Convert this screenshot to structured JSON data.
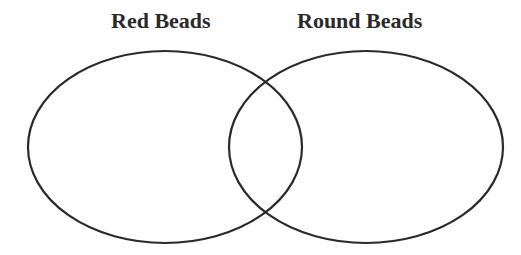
{
  "diagram": {
    "type": "venn",
    "sets": [
      {
        "label": "Red Beads",
        "cx": 165,
        "cy": 147,
        "rx": 137,
        "ry": 96
      },
      {
        "label": "Round Beads",
        "cx": 366,
        "cy": 147,
        "rx": 137,
        "ry": 96
      }
    ],
    "stroke_color": "#2a2a2a"
  }
}
